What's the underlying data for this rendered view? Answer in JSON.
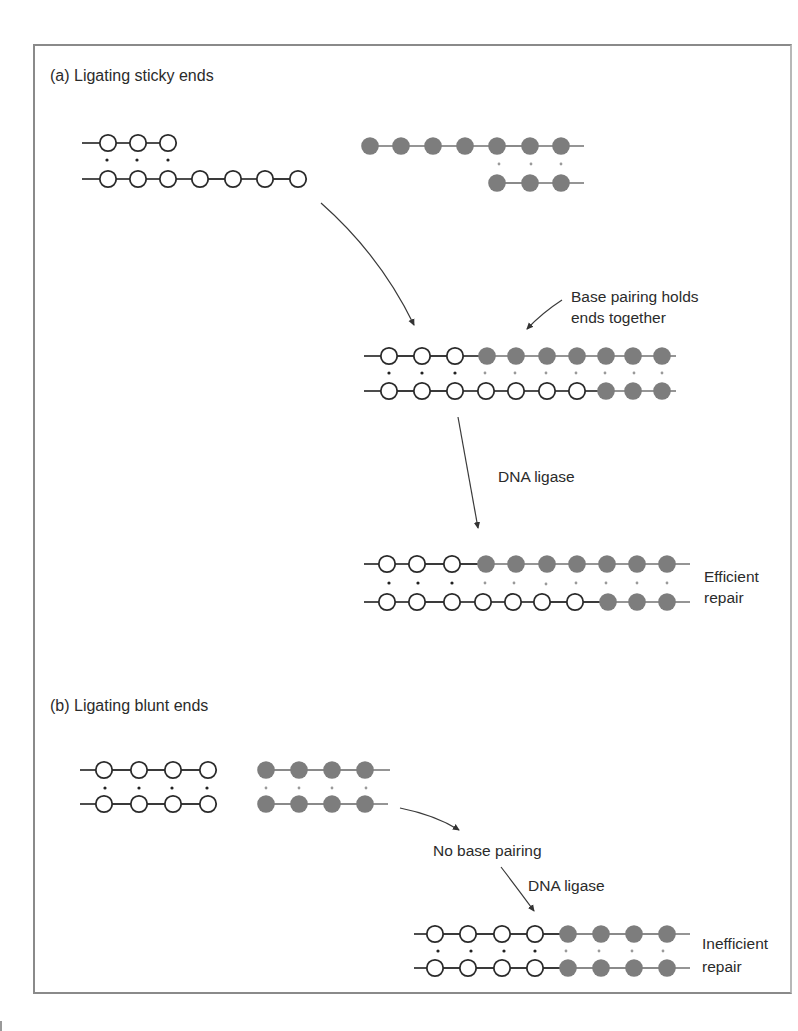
{
  "figure": {
    "panel_a": {
      "title": "(a) Ligating sticky ends",
      "annotation_base_pairing": "Base pairing holds\nends together",
      "annotation_ligase": "DNA ligase",
      "result_label": "Efficient\nrepair"
    },
    "panel_b": {
      "title": "(b) Ligating blunt ends",
      "annotation_no_pairing": "No base pairing",
      "annotation_ligase": "DNA ligase",
      "result_label": "Inefficient\nrepair"
    },
    "colors": {
      "open_nucleotide_stroke": "#2a2a2a",
      "filled_nucleotide": "#7d7d7d",
      "backbone": "#3a3a3a",
      "filled_backbone": "#8a8a8a",
      "frame": "#8a8a8a"
    },
    "molecules": [
      {
        "name": "sticky-left-fragment",
        "rows": [
          {
            "y": 143,
            "x_start": 82,
            "x_end": 168,
            "nodes": [
              {
                "x": 108,
                "t": "o"
              },
              {
                "x": 138,
                "t": "o"
              },
              {
                "x": 168,
                "t": "o"
              }
            ]
          },
          {
            "y": 179,
            "x_start": 82,
            "x_end": 298,
            "nodes": [
              {
                "x": 108,
                "t": "o"
              },
              {
                "x": 138,
                "t": "o"
              },
              {
                "x": 168,
                "t": "o"
              },
              {
                "x": 200,
                "t": "o"
              },
              {
                "x": 233,
                "t": "o"
              },
              {
                "x": 265,
                "t": "o"
              },
              {
                "x": 298,
                "t": "o"
              }
            ]
          }
        ],
        "pair_dots": [
          {
            "x": 107,
            "y": 160,
            "t": "o"
          },
          {
            "x": 137,
            "y": 160,
            "t": "o"
          },
          {
            "x": 168,
            "y": 160,
            "t": "o"
          }
        ]
      },
      {
        "name": "sticky-right-fragment",
        "rows": [
          {
            "y": 146,
            "x_start": 368,
            "x_end": 584,
            "nodes": [
              {
                "x": 370,
                "t": "f"
              },
              {
                "x": 401,
                "t": "f"
              },
              {
                "x": 433,
                "t": "f"
              },
              {
                "x": 465,
                "t": "f"
              },
              {
                "x": 497,
                "t": "f"
              },
              {
                "x": 530,
                "t": "f"
              },
              {
                "x": 561,
                "t": "f"
              }
            ]
          },
          {
            "y": 183,
            "x_start": 494,
            "x_end": 584,
            "nodes": [
              {
                "x": 497,
                "t": "f"
              },
              {
                "x": 530,
                "t": "f"
              },
              {
                "x": 561,
                "t": "f"
              }
            ]
          }
        ],
        "pair_dots": [
          {
            "x": 499,
            "y": 164,
            "t": "f"
          },
          {
            "x": 531,
            "y": 164,
            "t": "f"
          },
          {
            "x": 561,
            "y": 164,
            "t": "f"
          }
        ]
      },
      {
        "name": "sticky-annealed-molecule",
        "rows": [
          {
            "y": 356,
            "x_start": 364,
            "x_end": 676,
            "nodes": [
              {
                "x": 389,
                "t": "o"
              },
              {
                "x": 422,
                "t": "o"
              },
              {
                "x": 455,
                "t": "o"
              },
              {
                "x": 487,
                "t": "f"
              },
              {
                "x": 516,
                "t": "f"
              },
              {
                "x": 547,
                "t": "f"
              },
              {
                "x": 577,
                "t": "f"
              },
              {
                "x": 606,
                "t": "f"
              },
              {
                "x": 633,
                "t": "f"
              },
              {
                "x": 662,
                "t": "f"
              }
            ]
          },
          {
            "y": 391,
            "x_start": 364,
            "x_end": 676,
            "nodes": [
              {
                "x": 389,
                "t": "o"
              },
              {
                "x": 422,
                "t": "o"
              },
              {
                "x": 455,
                "t": "o"
              },
              {
                "x": 486,
                "t": "o"
              },
              {
                "x": 516,
                "t": "o"
              },
              {
                "x": 547,
                "t": "o"
              },
              {
                "x": 577,
                "t": "o"
              },
              {
                "x": 606,
                "t": "f"
              },
              {
                "x": 633,
                "t": "f"
              },
              {
                "x": 662,
                "t": "f"
              }
            ]
          }
        ],
        "pair_dots": [
          {
            "x": 389,
            "y": 373,
            "t": "o"
          },
          {
            "x": 422,
            "y": 373,
            "t": "o"
          },
          {
            "x": 455,
            "y": 373,
            "t": "o"
          },
          {
            "x": 485,
            "y": 373,
            "t": "f"
          },
          {
            "x": 515,
            "y": 373,
            "t": "f"
          },
          {
            "x": 546,
            "y": 373,
            "t": "f"
          },
          {
            "x": 576,
            "y": 373,
            "t": "f"
          },
          {
            "x": 605,
            "y": 373,
            "t": "f"
          },
          {
            "x": 634,
            "y": 373,
            "t": "f"
          },
          {
            "x": 662,
            "y": 373,
            "t": "f"
          }
        ]
      },
      {
        "name": "sticky-ligated-molecule",
        "rows": [
          {
            "y": 564,
            "x_start": 364,
            "x_end": 690,
            "nodes": [
              {
                "x": 387,
                "t": "o"
              },
              {
                "x": 417,
                "t": "o"
              },
              {
                "x": 452,
                "t": "o"
              },
              {
                "x": 486,
                "t": "f"
              },
              {
                "x": 516,
                "t": "f"
              },
              {
                "x": 547,
                "t": "f"
              },
              {
                "x": 577,
                "t": "f"
              },
              {
                "x": 607,
                "t": "f"
              },
              {
                "x": 637,
                "t": "f"
              },
              {
                "x": 667,
                "t": "f"
              }
            ]
          },
          {
            "y": 602,
            "x_start": 364,
            "x_end": 690,
            "nodes": [
              {
                "x": 387,
                "t": "o"
              },
              {
                "x": 417,
                "t": "o"
              },
              {
                "x": 452,
                "t": "o"
              },
              {
                "x": 483,
                "t": "o"
              },
              {
                "x": 513,
                "t": "o"
              },
              {
                "x": 542,
                "t": "o"
              },
              {
                "x": 575,
                "t": "o"
              },
              {
                "x": 608,
                "t": "f"
              },
              {
                "x": 637,
                "t": "f"
              },
              {
                "x": 667,
                "t": "f"
              }
            ]
          }
        ],
        "pair_dots": [
          {
            "x": 389,
            "y": 583,
            "t": "o"
          },
          {
            "x": 418,
            "y": 583,
            "t": "o"
          },
          {
            "x": 452,
            "y": 583,
            "t": "o"
          },
          {
            "x": 485,
            "y": 583,
            "t": "f"
          },
          {
            "x": 514,
            "y": 583,
            "t": "f"
          },
          {
            "x": 546,
            "y": 584,
            "t": "f"
          },
          {
            "x": 576,
            "y": 583,
            "t": "f"
          },
          {
            "x": 606,
            "y": 583,
            "t": "f"
          },
          {
            "x": 637,
            "y": 583,
            "t": "f"
          },
          {
            "x": 667,
            "y": 583,
            "t": "f"
          }
        ]
      },
      {
        "name": "blunt-left-fragment",
        "rows": [
          {
            "y": 770,
            "x_start": 80,
            "x_end": 213,
            "nodes": [
              {
                "x": 104,
                "t": "o"
              },
              {
                "x": 139,
                "t": "o"
              },
              {
                "x": 173,
                "t": "o"
              },
              {
                "x": 208,
                "t": "o"
              }
            ]
          },
          {
            "y": 804,
            "x_start": 80,
            "x_end": 213,
            "nodes": [
              {
                "x": 104,
                "t": "o"
              },
              {
                "x": 139,
                "t": "o"
              },
              {
                "x": 173,
                "t": "o"
              },
              {
                "x": 208,
                "t": "o"
              }
            ]
          }
        ],
        "pair_dots": [
          {
            "x": 105,
            "y": 788,
            "t": "o"
          },
          {
            "x": 139,
            "y": 788,
            "t": "o"
          },
          {
            "x": 172,
            "y": 788,
            "t": "o"
          },
          {
            "x": 207,
            "y": 788,
            "t": "o"
          }
        ]
      },
      {
        "name": "blunt-right-fragment",
        "rows": [
          {
            "y": 770,
            "x_start": 262,
            "x_end": 390,
            "nodes": [
              {
                "x": 266,
                "t": "f"
              },
              {
                "x": 299,
                "t": "f"
              },
              {
                "x": 332,
                "t": "f"
              },
              {
                "x": 365,
                "t": "f"
              }
            ]
          },
          {
            "y": 804,
            "x_start": 262,
            "x_end": 388,
            "nodes": [
              {
                "x": 266,
                "t": "f"
              },
              {
                "x": 299,
                "t": "f"
              },
              {
                "x": 332,
                "t": "f"
              },
              {
                "x": 365,
                "t": "f"
              }
            ]
          }
        ],
        "pair_dots": [
          {
            "x": 266,
            "y": 788,
            "t": "f"
          },
          {
            "x": 299,
            "y": 788,
            "t": "f"
          },
          {
            "x": 332,
            "y": 788,
            "t": "f"
          },
          {
            "x": 366,
            "y": 788,
            "t": "f"
          }
        ]
      },
      {
        "name": "blunt-ligated-molecule",
        "rows": [
          {
            "y": 934,
            "x_start": 414,
            "x_end": 690,
            "nodes": [
              {
                "x": 435,
                "t": "o"
              },
              {
                "x": 468,
                "t": "o"
              },
              {
                "x": 502,
                "t": "o"
              },
              {
                "x": 535,
                "t": "o"
              },
              {
                "x": 568,
                "t": "f"
              },
              {
                "x": 601,
                "t": "f"
              },
              {
                "x": 634,
                "t": "f"
              },
              {
                "x": 667,
                "t": "f"
              }
            ]
          },
          {
            "y": 968,
            "x_start": 414,
            "x_end": 690,
            "nodes": [
              {
                "x": 435,
                "t": "o"
              },
              {
                "x": 468,
                "t": "o"
              },
              {
                "x": 502,
                "t": "o"
              },
              {
                "x": 535,
                "t": "o"
              },
              {
                "x": 568,
                "t": "f"
              },
              {
                "x": 601,
                "t": "f"
              },
              {
                "x": 634,
                "t": "f"
              },
              {
                "x": 667,
                "t": "f"
              }
            ]
          }
        ],
        "pair_dots": [
          {
            "x": 438,
            "y": 951,
            "t": "o"
          },
          {
            "x": 471,
            "y": 951,
            "t": "o"
          },
          {
            "x": 504,
            "y": 951,
            "t": "o"
          },
          {
            "x": 535,
            "y": 951,
            "t": "o"
          },
          {
            "x": 566,
            "y": 951,
            "t": "f"
          },
          {
            "x": 599,
            "y": 951,
            "t": "f"
          },
          {
            "x": 632,
            "y": 951,
            "t": "f"
          },
          {
            "x": 663,
            "y": 951,
            "t": "f"
          }
        ]
      }
    ],
    "arrows": [
      {
        "name": "arrow-fragments-to-annealed",
        "path": "M 321 203 Q 380 255 414 325",
        "tip": [
          414,
          327
        ]
      },
      {
        "name": "arrow-base-pairing-pointer",
        "path": "M 562 300 Q 542 313 527 329",
        "tip": [
          525,
          332
        ]
      },
      {
        "name": "arrow-annealed-to-ligated",
        "path": "M 458 417 L 478 528",
        "tip": [
          479,
          531
        ]
      },
      {
        "name": "arrow-blunt-to-no-pairing",
        "path": "M 400 808 Q 435 815 459 830",
        "tip": [
          461,
          832
        ]
      },
      {
        "name": "arrow-no-pairing-to-ligated",
        "path": "M 501 867 Q 521 893 534 911",
        "tip": [
          536,
          913
        ]
      }
    ]
  }
}
